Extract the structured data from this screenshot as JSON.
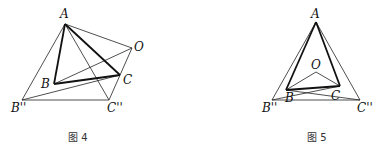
{
  "figures": [
    {
      "caption": "图 4",
      "points": {
        "A": {
          "label": "A",
          "x": 65,
          "y": 24
        },
        "O": {
          "label": "O",
          "x": 132,
          "y": 48
        },
        "B": {
          "label": "B",
          "x": 54,
          "y": 84
        },
        "C": {
          "label": "C",
          "x": 120,
          "y": 75
        },
        "B2": {
          "label": "B''",
          "x": 22,
          "y": 100
        },
        "C2": {
          "label": "C''",
          "x": 109,
          "y": 100
        }
      },
      "thick_segments": [
        [
          "A",
          "B"
        ],
        [
          "A",
          "C"
        ],
        [
          "B",
          "C"
        ]
      ],
      "thin_segments": [
        [
          "A",
          "O"
        ],
        [
          "A",
          "B2"
        ],
        [
          "A",
          "C2"
        ],
        [
          "B2",
          "C2"
        ],
        [
          "O",
          "C2"
        ],
        [
          "B",
          "O"
        ],
        [
          "B2",
          "C"
        ]
      ]
    },
    {
      "caption": "图 5",
      "points": {
        "A": {
          "label": "A",
          "x": 316,
          "y": 22
        },
        "O": {
          "label": "O",
          "x": 316,
          "y": 72
        },
        "B": {
          "label": "B",
          "x": 286,
          "y": 90
        },
        "C": {
          "label": "C",
          "x": 340,
          "y": 86
        },
        "B2": {
          "label": "B''",
          "x": 272,
          "y": 100
        },
        "C2": {
          "label": "C''",
          "x": 360,
          "y": 100
        }
      },
      "thick_segments": [
        [
          "A",
          "B"
        ],
        [
          "A",
          "C"
        ],
        [
          "B",
          "C"
        ]
      ],
      "thin_segments": [
        [
          "A",
          "B2"
        ],
        [
          "A",
          "C2"
        ],
        [
          "B2",
          "C2"
        ],
        [
          "O",
          "B"
        ],
        [
          "O",
          "C"
        ],
        [
          "B2",
          "C"
        ],
        [
          "B",
          "C2"
        ]
      ]
    }
  ]
}
